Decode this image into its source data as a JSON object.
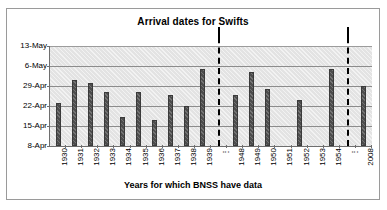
{
  "chart_data": {
    "type": "bar",
    "title": "Arrival dates for Swifts",
    "xlabel": "Years for which BNSS have data",
    "ylabel": "",
    "grid": true,
    "legend": false,
    "categories": [
      "1930",
      "1931",
      "1932",
      "1933",
      "1934",
      "1935",
      "1936",
      "1937",
      "1938",
      "1939",
      "⋮",
      "1948",
      "1949",
      "1950",
      "1951",
      "1952",
      "1953",
      "1954",
      "⋮",
      "2008"
    ],
    "ytick_labels": [
      "13-May",
      "6-May",
      "29-Apr",
      "22-Apr",
      "15-Apr",
      "8-Apr"
    ],
    "ytick_values": [
      35,
      28,
      21,
      14,
      7,
      0
    ],
    "ylim": [
      0,
      35
    ],
    "ylim_labels": [
      "8-Apr",
      "13-May"
    ],
    "value_unit": "days after 8-Apr",
    "values": [
      15,
      23,
      22,
      19,
      10,
      19,
      9,
      18,
      14,
      27,
      null,
      18,
      26,
      20,
      null,
      16,
      null,
      27,
      null,
      21
    ],
    "value_dates": [
      "23-Apr",
      "1-May",
      "30-Apr",
      "27-Apr",
      "18-Apr",
      "27-Apr",
      "17-Apr",
      "26-Apr",
      "22-Apr",
      "5-May",
      null,
      "26-Apr",
      "4-May",
      "28-Apr",
      null,
      "24-Apr",
      null,
      "5-May",
      null,
      "29-Apr"
    ],
    "break_markers": [
      {
        "after_category": "1939",
        "style": "dash-dot-vertical"
      },
      {
        "after_category": "1954",
        "style": "dash-dot-vertical"
      }
    ],
    "colors": {
      "bar": "#4d4d4d",
      "bar_border": "#3a3a3a",
      "plot_background": "#e3e3e3",
      "gridline": "#8c8c8c",
      "axis": "#6e6e6e",
      "frame_border": "#9a9a9a",
      "text": "#000000",
      "break_marker": "#000000"
    }
  }
}
